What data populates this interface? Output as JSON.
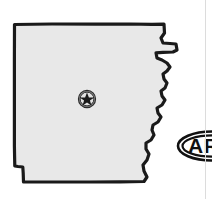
{
  "map": {
    "state_name": "Arkansas",
    "state_abbreviation": "AR",
    "title": "Arkansas",
    "fill_color": "#e8e8e8",
    "outline_color": "#1a1a1a",
    "background_color": "#ffffff"
  },
  "capital_marker": {
    "label": "Little Rock",
    "type": "capital-star",
    "x": 87,
    "y": 99,
    "circle_color": "#3a3a3a",
    "star_color": "#1a1a1a",
    "ring_color": "#8a8a8a"
  },
  "badge": {
    "abbreviation": "AR",
    "shape": "oval",
    "border_color": "#111111",
    "text_color": "#111111",
    "fill_color": "#ffffff"
  },
  "divider": {
    "color": "#dcdcdc"
  }
}
